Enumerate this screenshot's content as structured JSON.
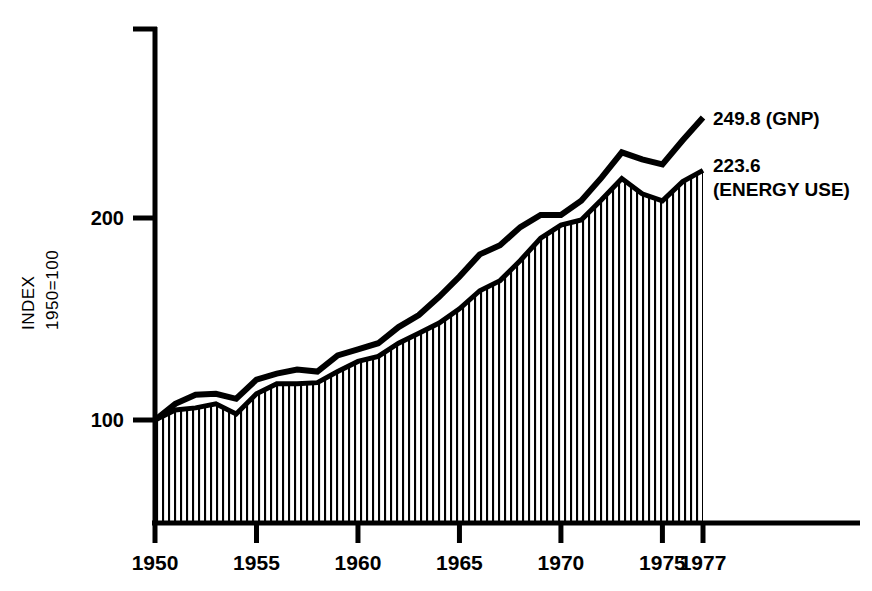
{
  "chart_data": {
    "type": "line",
    "title": "",
    "subtitle": "",
    "xlabel": "",
    "ylabel": "INDEX 1950=100",
    "ylabel_line1": "INDEX",
    "ylabel_line2": "1950=100",
    "xlim": [
      1950,
      1977
    ],
    "ylim": [
      60,
      280
    ],
    "grid": false,
    "legend_position": "right-annotations",
    "ytick_labels": [
      "100",
      "200"
    ],
    "yticks": [
      100,
      200
    ],
    "xtick_labels": [
      "1950",
      "1955",
      "1960",
      "1965",
      "1970",
      "1975",
      "1977"
    ],
    "xticks": [
      1950,
      1955,
      1960,
      1965,
      1970,
      1975,
      1977
    ],
    "x": [
      1950,
      1951,
      1952,
      1953,
      1954,
      1955,
      1956,
      1957,
      1958,
      1959,
      1960,
      1961,
      1962,
      1963,
      1964,
      1965,
      1966,
      1967,
      1968,
      1969,
      1970,
      1971,
      1972,
      1973,
      1974,
      1975,
      1976,
      1977
    ],
    "series": [
      {
        "name": "GNP",
        "label": "249.8 (GNP)",
        "end_value": 249.8,
        "style": "thick-black-line",
        "values": [
          100.0,
          108.0,
          112.5,
          113.0,
          110.5,
          120.0,
          123.0,
          125.0,
          124.0,
          132.0,
          135.0,
          138.0,
          146.0,
          152.0,
          161.0,
          171.0,
          182.0,
          186.5,
          195.5,
          201.5,
          201.5,
          208.5,
          220.0,
          232.5,
          229.0,
          226.5,
          238.5,
          249.8
        ]
      },
      {
        "name": "ENERGY USE",
        "label_value": "223.6",
        "label_name": "(ENERGY USE)",
        "end_value": 223.6,
        "style": "vertical-hatched-area",
        "values": [
          100.0,
          105.0,
          106.0,
          108.0,
          103.0,
          113.0,
          118.0,
          118.0,
          118.5,
          124.0,
          129.0,
          131.5,
          138.0,
          143.0,
          148.0,
          155.0,
          164.0,
          169.0,
          179.0,
          190.0,
          196.5,
          199.0,
          209.0,
          219.5,
          212.0,
          208.5,
          218.0,
          223.6
        ]
      }
    ],
    "annotations": [
      {
        "text": "249.8 (GNP)",
        "x": 1977,
        "y": 249.8,
        "position": "right"
      },
      {
        "text": "223.6",
        "x": 1977,
        "y": 223.6,
        "position": "right"
      },
      {
        "text": "(ENERGY USE)",
        "x": 1977,
        "y": 223.6,
        "position": "right-below"
      }
    ],
    "colors": {
      "line": "#000000",
      "hatch": "#000000",
      "axis": "#000000",
      "background": "#ffffff"
    }
  }
}
